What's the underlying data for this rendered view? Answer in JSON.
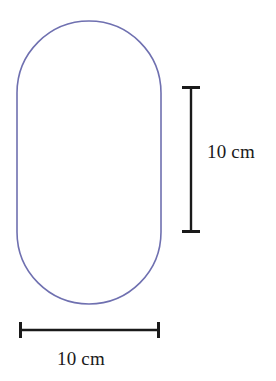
{
  "figure": {
    "background_color": "#ffffff",
    "shape": {
      "name": "capsule-outline",
      "kind": "stadium",
      "stroke_color": "#6f70b0",
      "stroke_width": 1.6,
      "fill": "none",
      "x": 17,
      "y": 21,
      "width": 144,
      "height": 283,
      "corner_radius": 72
    },
    "dimensions": [
      {
        "id": "vertical",
        "name": "vertical-dimension",
        "label": "10 cm",
        "value": 10,
        "unit": "cm",
        "orientation": "vertical",
        "color": "#1a1a1a",
        "line_x": 191,
        "line_y1": 87,
        "line_y2": 232,
        "cap_half_length": 9,
        "line_width": 2.4,
        "cap_width": 3
      },
      {
        "id": "horizontal",
        "name": "horizontal-dimension",
        "label": "10 cm",
        "value": 10,
        "unit": "cm",
        "orientation": "horizontal",
        "color": "#1a1a1a",
        "line_y": 330,
        "line_x1": 20,
        "line_x2": 159,
        "cap_half_length": 8,
        "line_width": 2.4,
        "cap_width": 3
      }
    ]
  },
  "labels": {
    "vertical_dimension": "10 cm",
    "horizontal_dimension": "10 cm"
  }
}
